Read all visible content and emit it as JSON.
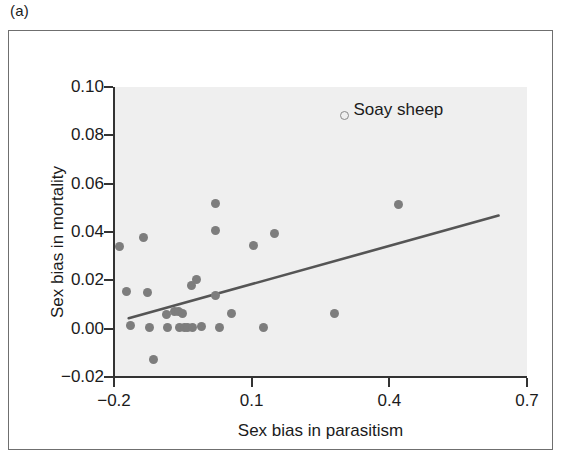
{
  "figure": {
    "panel_label": "(a)",
    "background_color": "#efefef",
    "point_color": "#7d7d7d",
    "line_color": "#555555",
    "axis_color": "#333333"
  },
  "chart_data": {
    "type": "scatter",
    "title": "",
    "xlabel": "Sex bias in parasitism",
    "ylabel": "Sex bias in mortality",
    "xlim": [
      -0.2,
      0.7
    ],
    "ylim": [
      -0.02,
      0.1
    ],
    "xticks": [
      -0.2,
      0.1,
      0.4,
      0.7
    ],
    "xtick_labels": [
      "−0.2",
      "0.1",
      "0.4",
      "0.7"
    ],
    "yticks": [
      -0.02,
      0.0,
      0.02,
      0.04,
      0.06,
      0.08,
      0.1
    ],
    "ytick_labels": [
      "−0.02",
      "0.00",
      "0.02",
      "0.04",
      "0.06",
      "0.08",
      "0.10"
    ],
    "grid": false,
    "legend": false,
    "series": [
      {
        "name": "species",
        "marker": "filled-circle",
        "color": "#7d7d7d",
        "points": [
          {
            "x": -0.188,
            "y": 0.0338
          },
          {
            "x": -0.173,
            "y": 0.0152
          },
          {
            "x": -0.165,
            "y": 0.0015
          },
          {
            "x": -0.135,
            "y": 0.0378
          },
          {
            "x": -0.128,
            "y": 0.0148
          },
          {
            "x": -0.122,
            "y": 0.0005
          },
          {
            "x": -0.113,
            "y": -0.0128
          },
          {
            "x": -0.085,
            "y": 0.006
          },
          {
            "x": -0.083,
            "y": 0.0005
          },
          {
            "x": -0.068,
            "y": 0.0072
          },
          {
            "x": -0.06,
            "y": 0.007
          },
          {
            "x": -0.058,
            "y": 0.0005
          },
          {
            "x": -0.05,
            "y": 0.0062
          },
          {
            "x": -0.046,
            "y": 0.0005
          },
          {
            "x": -0.04,
            "y": 0.0005
          },
          {
            "x": -0.032,
            "y": 0.0178
          },
          {
            "x": -0.028,
            "y": 0.0005
          },
          {
            "x": -0.02,
            "y": 0.0205
          },
          {
            "x": -0.01,
            "y": 0.0008
          },
          {
            "x": 0.022,
            "y": 0.0518
          },
          {
            "x": 0.022,
            "y": 0.0408
          },
          {
            "x": 0.022,
            "y": 0.0138
          },
          {
            "x": 0.03,
            "y": 0.0005
          },
          {
            "x": 0.055,
            "y": 0.0062
          },
          {
            "x": 0.105,
            "y": 0.0345
          },
          {
            "x": 0.125,
            "y": 0.0005
          },
          {
            "x": 0.15,
            "y": 0.0392
          },
          {
            "x": 0.28,
            "y": 0.0062
          },
          {
            "x": 0.42,
            "y": 0.0512
          }
        ]
      },
      {
        "name": "Soay sheep",
        "marker": "open-circle",
        "color": "#8a8a8a",
        "points": [
          {
            "x": 0.303,
            "y": 0.0882
          }
        ]
      }
    ],
    "annotations": [
      {
        "text": "Soay sheep",
        "x": 0.322,
        "y": 0.0905
      }
    ],
    "trendline": {
      "type": "linear",
      "x_start": -0.168,
      "y_start": 0.0043,
      "x_end": 0.638,
      "y_end": 0.0468
    }
  }
}
